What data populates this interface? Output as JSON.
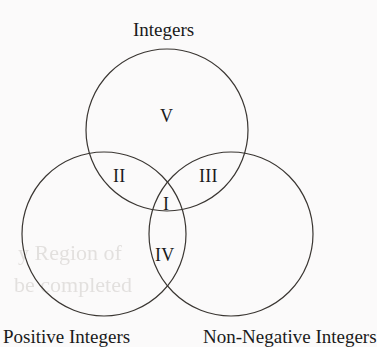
{
  "figure": {
    "type": "venn-diagram",
    "sets": 3,
    "background_color": "#fbfafa",
    "stroke_color": "#3a3632",
    "text_color": "#1a1a1a"
  },
  "set_labels": {
    "top": "Integers",
    "bottom_left": "Positive Integers",
    "bottom_right": "Non-Negative Integers"
  },
  "regions": {
    "center": "I",
    "top_left": "II",
    "top_right": "III",
    "bottom": "IV",
    "top_only": "V"
  },
  "circles": {
    "top": {
      "cx": 167,
      "cy": 130,
      "r": 81
    },
    "left": {
      "cx": 104,
      "cy": 234,
      "r": 82
    },
    "right": {
      "cx": 231,
      "cy": 234,
      "r": 82
    }
  },
  "artifacts": {
    "bleed_line_1": "y Region of",
    "bleed_line_2": "be completed"
  }
}
